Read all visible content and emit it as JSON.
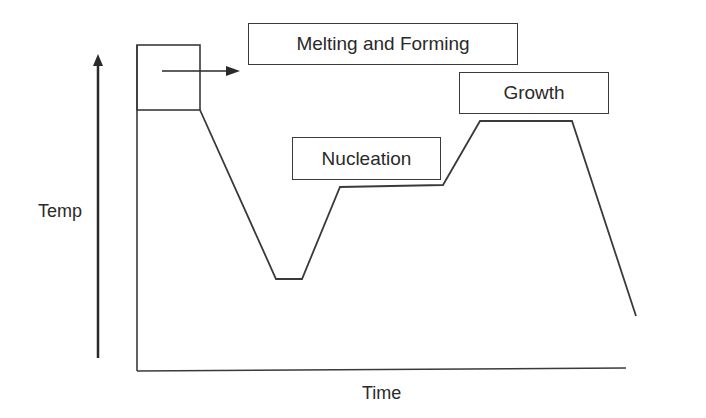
{
  "diagram": {
    "type": "temperature-time process profile",
    "axes": {
      "y_label": "Temp",
      "x_label": "Time"
    },
    "stages": [
      {
        "label": "Melting and Forming"
      },
      {
        "label": "Nucleation"
      },
      {
        "label": "Growth"
      }
    ],
    "colors": {
      "line": "#3a3a3a",
      "background": "#ffffff",
      "text": "#2a2a2a"
    }
  }
}
